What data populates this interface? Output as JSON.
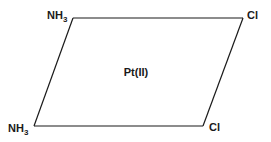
{
  "diagram": {
    "center": {
      "label": "Pt(II)"
    },
    "ligands": {
      "top_left": {
        "base": "NH",
        "subscript": "3"
      },
      "top_right": {
        "base": "Cl",
        "subscript": ""
      },
      "bottom_left": {
        "base": "NH",
        "subscript": "3"
      },
      "bottom_right": {
        "base": "Cl",
        "subscript": ""
      }
    },
    "colors": {
      "line": "#1a1a1a",
      "text": "#1a1a1a",
      "background": "#ffffff"
    }
  }
}
